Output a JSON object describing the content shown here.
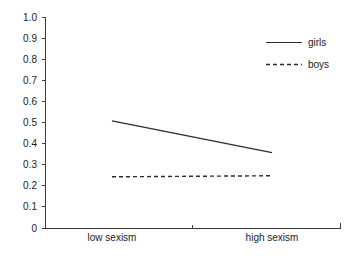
{
  "chart_data": {
    "type": "line",
    "title": "",
    "subtitle": "",
    "xlabel": "",
    "ylabel": "",
    "categories": [
      "low sexism",
      "high sexism"
    ],
    "x": [
      0,
      1
    ],
    "series": [
      {
        "name": "girls",
        "values": [
          0.51,
          0.36
        ],
        "style": "solid"
      },
      {
        "name": "boys",
        "values": [
          0.245,
          0.25
        ],
        "style": "dashed"
      }
    ],
    "ylim": [
      0,
      1.0
    ],
    "ytick_labels": [
      "0",
      "0.1",
      "0.2",
      "0.3",
      "0.4",
      "0.5",
      "0.6",
      "0.7",
      "0.8",
      "0.9",
      "1.0"
    ],
    "ytick_values": [
      0,
      0.1,
      0.2,
      0.3,
      0.4,
      0.5,
      0.6,
      0.7,
      0.8,
      0.9,
      1.0
    ],
    "xtick_labels": [
      "low sexism",
      "high sexism"
    ],
    "grid": false,
    "legend_position": "top-right",
    "legend": [
      "girls",
      "boys"
    ],
    "colors": {
      "axis": "#3a3a3a",
      "series_girls": "#2b2b2b",
      "series_boys": "#2b2b2b",
      "background": "#ffffff",
      "text": "#1a1a1a"
    }
  },
  "axis": {
    "y": {
      "t10": "1.0",
      "t09": "0.9",
      "t08": "0.8",
      "t07": "0.7",
      "t06": "0.6",
      "t05": "0.5",
      "t04": "0.4",
      "t03": "0.3",
      "t02": "0.2",
      "t01": "0.1",
      "t00": "0"
    },
    "x": {
      "cat_low": "low sexism",
      "cat_high": "high sexism"
    }
  },
  "legend": {
    "girls": "girls",
    "boys": "boys"
  }
}
